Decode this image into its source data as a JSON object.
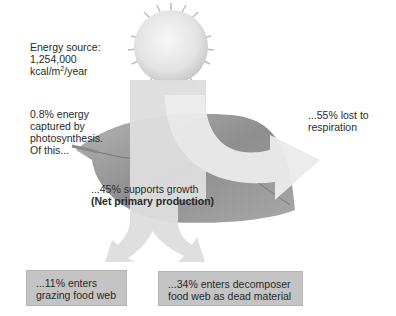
{
  "diagram": {
    "energy_source": {
      "line1": "Energy source:",
      "line2": "1,254,000",
      "unit_prefix": "kcal/m",
      "unit_sup": "2",
      "unit_suffix": "/year"
    },
    "captured": {
      "line1": "0.8% energy",
      "line2": "captured by",
      "line3": "photosynthesis.",
      "line4": "Of this..."
    },
    "respiration": {
      "line1": "...55% lost to",
      "line2": "respiration"
    },
    "growth": {
      "line1": "...45% supports growth",
      "line2": "(Net primary production)"
    },
    "grazing": {
      "line1": "...11% enters",
      "line2": "grazing food web"
    },
    "decomposer": {
      "line1": "...34% enters decomposer",
      "line2": "food web as dead material"
    },
    "colors": {
      "arrow": "#dcdcdc",
      "leaf": "#9a9a9a",
      "sun": "#e6e6e6",
      "box": "#c4c4c4"
    }
  }
}
